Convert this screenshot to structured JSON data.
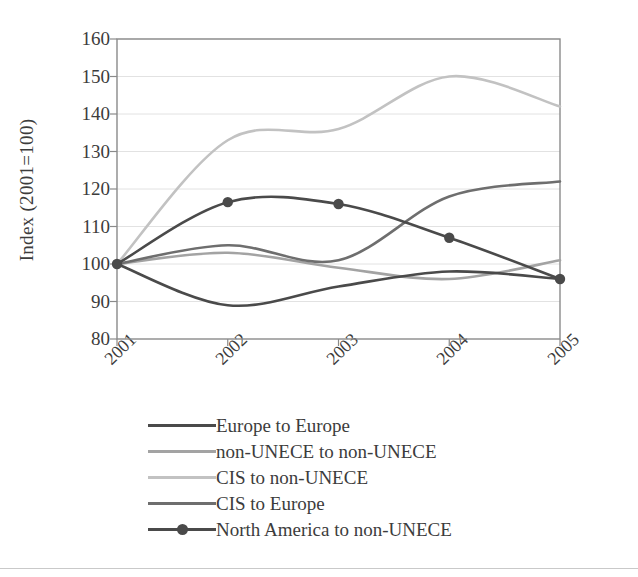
{
  "chart_data": {
    "type": "line",
    "title": "",
    "xlabel": "",
    "ylabel": "Index (2001=100)",
    "x": [
      2001,
      2002,
      2003,
      2004,
      2005
    ],
    "xticklabels": [
      "2001",
      "2002",
      "2003",
      "2004",
      "2005"
    ],
    "yticklabels": [
      "80",
      "90",
      "100",
      "110",
      "120",
      "130",
      "140",
      "150",
      "160"
    ],
    "yticks": [
      80,
      90,
      100,
      110,
      120,
      130,
      140,
      150,
      160
    ],
    "ylim": [
      80,
      160
    ],
    "xlim": [
      2001,
      2005
    ],
    "grid": "horizontal",
    "legend_position": "below",
    "series": [
      {
        "name": "Europe to Europe",
        "color": "#4a4a4a",
        "marker": "none",
        "values": [
          100,
          89,
          94,
          98,
          96
        ]
      },
      {
        "name": "non-UNECE to non-UNECE",
        "color": "#a3a3a3",
        "marker": "none",
        "values": [
          100,
          103,
          99,
          96,
          101
        ]
      },
      {
        "name": "CIS to non-UNECE",
        "color": "#c2c2c2",
        "marker": "none",
        "values": [
          100,
          133,
          136,
          150,
          142
        ]
      },
      {
        "name": "CIS to Europe",
        "color": "#6e6e6e",
        "marker": "none",
        "values": [
          100,
          105,
          101,
          118,
          122
        ]
      },
      {
        "name": "North America to non-UNECE",
        "color": "#4a4a4a",
        "marker": "circle",
        "values": [
          100,
          116.5,
          116,
          107,
          96
        ]
      }
    ],
    "axis_color": "#8a8a8a",
    "grid_color": "#e2e2e2"
  }
}
